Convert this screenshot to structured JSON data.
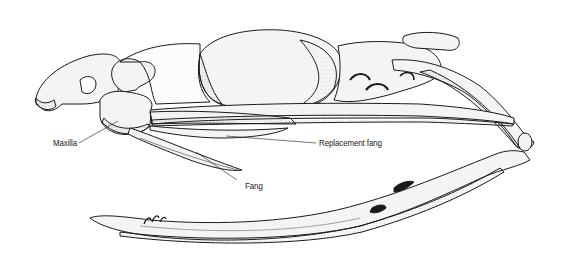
{
  "figure": {
    "labels": {
      "maxilla": "Maxilla",
      "replacement_fang": "Replacement fang",
      "fang": "Fang"
    },
    "colors": {
      "ink": "#1a1a1a",
      "bone_fill": "#f4f4f2",
      "shade": "#9a9a9a",
      "background": "#ffffff"
    }
  }
}
